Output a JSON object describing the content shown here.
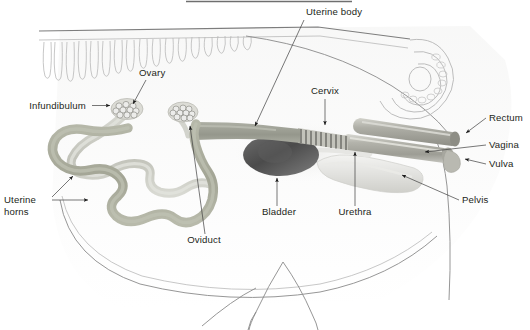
{
  "figure": {
    "width": 530,
    "height": 330,
    "background": "#ffffff"
  },
  "labels": {
    "uterine_body": "Uterine body",
    "ovary": "Ovary",
    "infundibulum": "Infundibulum",
    "cervix": "Cervix",
    "rectum": "Rectum",
    "vagina": "Vagina",
    "vulva": "Vulva",
    "pelvis": "Pelvis",
    "urethra": "Urethra",
    "bladder": "Bladder",
    "oviduct": "Oviduct",
    "uterine_horns_line1": "Uterine",
    "uterine_horns_line2": "horns"
  },
  "colors": {
    "text": "#231f20",
    "leader": "#3d3d3d",
    "body_outline": "#8a8a8a",
    "soft_outline": "#b9b9b9",
    "uterine_horn": "#a8aa9a",
    "oviduct": "#c9cac2",
    "uterine_body": "#9a9c92",
    "bladder_dark": "#4a4a4a",
    "cervix": "#b5b5ad",
    "rectum": "#b0b0a8",
    "vagina": "#bdbdb5",
    "pelvis": "#e3e3e0",
    "ovary": "#d8d8d2"
  },
  "structures": [
    {
      "name": "spine",
      "kind": "outline"
    },
    {
      "name": "tail",
      "kind": "outline"
    },
    {
      "name": "body-outline",
      "kind": "outline"
    },
    {
      "name": "hind-leg",
      "kind": "outline"
    },
    {
      "name": "ovary-left",
      "kind": "organ"
    },
    {
      "name": "ovary-right",
      "kind": "organ"
    },
    {
      "name": "uterine-horns",
      "kind": "organ"
    },
    {
      "name": "oviduct",
      "kind": "organ"
    },
    {
      "name": "uterine-body",
      "kind": "organ"
    },
    {
      "name": "cervix",
      "kind": "organ"
    },
    {
      "name": "vagina",
      "kind": "organ"
    },
    {
      "name": "vulva",
      "kind": "organ"
    },
    {
      "name": "rectum",
      "kind": "organ"
    },
    {
      "name": "bladder",
      "kind": "organ"
    },
    {
      "name": "urethra",
      "kind": "organ"
    },
    {
      "name": "pelvis",
      "kind": "organ"
    }
  ]
}
